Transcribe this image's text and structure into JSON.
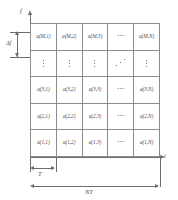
{
  "figure": {
    "axes": {
      "vertical_label": "f",
      "horizontal_label": "t"
    },
    "dimensions": {
      "subcarrier_spacing_label": "Δf",
      "symbol_duration_label": "T",
      "total_duration_label": "NT"
    },
    "grid": {
      "columns": 5,
      "rows": 5,
      "cells": [
        [
          "a(M,1)",
          "a(M,2)",
          "a(M,3)",
          "⋯",
          "a(M,N)"
        ],
        [
          "⋮",
          "⋮",
          "⋮",
          "⋰",
          "⋮"
        ],
        [
          "a(3,1)",
          "a(3,2)",
          "a(3,3)",
          "⋯",
          "a(3,N)"
        ],
        [
          "a(2,1)",
          "a(2,2)",
          "a(2,3)",
          "⋯",
          "a(2,N)"
        ],
        [
          "a(1,1)",
          "a(1,2)",
          "a(1,3)",
          "⋯",
          "a(1,N)"
        ]
      ]
    },
    "colors": {
      "grid_line": "#8c8c8c",
      "axis_line": "#6e6e6e",
      "text": "#4f4f4f",
      "background": "#ffffff"
    }
  }
}
